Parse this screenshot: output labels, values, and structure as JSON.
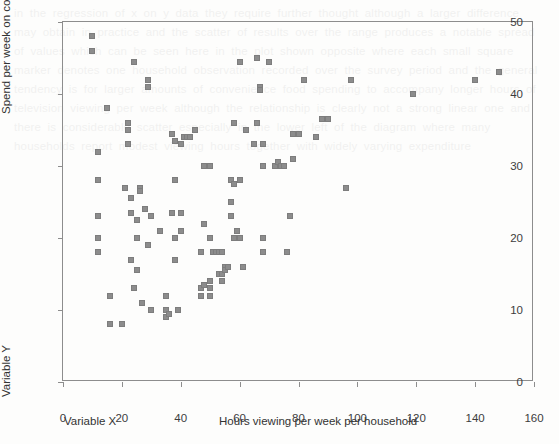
{
  "page": {
    "background_color": "#fdfdfc",
    "ghost_text": "in the regression of x on y data they require further thought although a larger difference may obtain in practice and the scatter of results over the range produces a notable spread of values which can be seen here in the plot shown opposite where each small square marker denotes one household observation recorded over the survey period and the general tendency is for larger amounts of convenience food spending to accompany longer hours of television viewing per week although the relationship is clearly not a strong linear one and there is considerable scatter especially in the lower left of the diagram where many households report modest viewing hours together with widely varying expenditure"
  },
  "chart_data": {
    "type": "scatter",
    "title": "",
    "xlabel": "Hours viewing per week per household",
    "ylabel": "Spend per week on convenience food (£)",
    "x_secondary_label": "Variable X",
    "y_secondary_label": "Variable Y",
    "xlim": [
      0,
      160
    ],
    "ylim": [
      0,
      50
    ],
    "xticks": [
      0,
      20,
      40,
      60,
      80,
      100,
      120,
      140,
      160
    ],
    "yticks": [
      0,
      10,
      20,
      30,
      40,
      50
    ],
    "grid": false,
    "legend": "none",
    "marker": {
      "shape": "square",
      "size_px": 6,
      "color": "#8c8c8c",
      "edge_color": "#7d7d7d"
    },
    "points": [
      [
        10,
        48.0
      ],
      [
        10,
        46.0
      ],
      [
        24,
        44.5
      ],
      [
        29,
        42.0
      ],
      [
        29,
        41.0
      ],
      [
        15,
        38.0
      ],
      [
        12,
        32.0
      ],
      [
        12,
        28.0
      ],
      [
        12,
        23.0
      ],
      [
        12,
        20.0
      ],
      [
        12,
        18.0
      ],
      [
        16,
        12.0
      ],
      [
        16,
        8.0
      ],
      [
        20,
        8.0
      ],
      [
        21,
        27.0
      ],
      [
        22,
        36.0
      ],
      [
        22,
        35.0
      ],
      [
        22,
        33.0
      ],
      [
        23,
        25.5
      ],
      [
        23,
        17.0
      ],
      [
        23,
        23.5
      ],
      [
        24,
        13.0
      ],
      [
        25,
        15.5
      ],
      [
        25,
        20.0
      ],
      [
        25,
        22.5
      ],
      [
        26,
        27.0
      ],
      [
        26,
        26.5
      ],
      [
        27,
        11.0
      ],
      [
        28,
        24.0
      ],
      [
        29,
        19.0
      ],
      [
        30,
        10.0
      ],
      [
        30,
        23.0
      ],
      [
        33,
        21.0
      ],
      [
        35,
        10.0
      ],
      [
        35,
        9.0
      ],
      [
        35,
        12.0
      ],
      [
        36,
        9.5
      ],
      [
        37,
        34.5
      ],
      [
        37,
        23.5
      ],
      [
        38,
        33.5
      ],
      [
        38,
        20.0
      ],
      [
        38,
        17.0
      ],
      [
        38,
        28.0
      ],
      [
        39,
        10.0
      ],
      [
        40,
        21.0
      ],
      [
        40,
        23.5
      ],
      [
        40,
        33.0
      ],
      [
        41,
        34.0
      ],
      [
        42,
        34.0
      ],
      [
        43,
        34.0
      ],
      [
        45,
        35.0
      ],
      [
        47,
        18.0
      ],
      [
        47,
        13.0
      ],
      [
        47,
        12.0
      ],
      [
        48,
        13.5
      ],
      [
        48,
        30.0
      ],
      [
        48,
        22.0
      ],
      [
        50,
        30.0
      ],
      [
        50,
        20.0
      ],
      [
        50,
        13.0
      ],
      [
        50,
        12.0
      ],
      [
        50,
        14.0
      ],
      [
        51,
        18.0
      ],
      [
        52,
        18.0
      ],
      [
        53,
        18.0
      ],
      [
        53,
        15.0
      ],
      [
        54,
        18.0
      ],
      [
        54,
        15.0
      ],
      [
        54,
        14.0
      ],
      [
        55,
        16.0
      ],
      [
        55,
        15.5
      ],
      [
        56,
        16.0
      ],
      [
        57,
        28.0
      ],
      [
        57,
        25.0
      ],
      [
        57,
        23.0
      ],
      [
        58,
        36.0
      ],
      [
        58,
        27.5
      ],
      [
        58,
        20.0
      ],
      [
        59,
        21.0
      ],
      [
        60,
        20.0
      ],
      [
        60,
        44.5
      ],
      [
        60,
        28.0
      ],
      [
        61,
        16.0
      ],
      [
        62,
        35.0
      ],
      [
        65,
        33.0
      ],
      [
        66,
        36.0
      ],
      [
        66,
        45.0
      ],
      [
        67,
        41.0
      ],
      [
        67,
        40.5
      ],
      [
        68,
        33.0
      ],
      [
        68,
        30.0
      ],
      [
        68,
        20.0
      ],
      [
        68,
        18.0
      ],
      [
        70,
        44.5
      ],
      [
        72,
        30.0
      ],
      [
        73,
        30.5
      ],
      [
        74,
        30.0
      ],
      [
        75,
        30.0
      ],
      [
        76,
        18.0
      ],
      [
        77,
        23.0
      ],
      [
        78,
        31.0
      ],
      [
        78,
        34.5
      ],
      [
        80,
        34.5
      ],
      [
        82,
        42.0
      ],
      [
        86,
        34.0
      ],
      [
        88,
        36.5
      ],
      [
        90,
        36.5
      ],
      [
        96,
        27.0
      ],
      [
        98,
        42.0
      ],
      [
        119,
        40.0
      ],
      [
        140,
        42.0
      ],
      [
        148,
        43.0
      ]
    ],
    "n_points": 113
  },
  "axes": {
    "x_tick_labels": [
      "0",
      "20",
      "40",
      "60",
      "80",
      "100",
      "120",
      "140",
      "160"
    ],
    "y_tick_labels": [
      "0",
      "10",
      "20",
      "30",
      "40",
      "50"
    ]
  }
}
